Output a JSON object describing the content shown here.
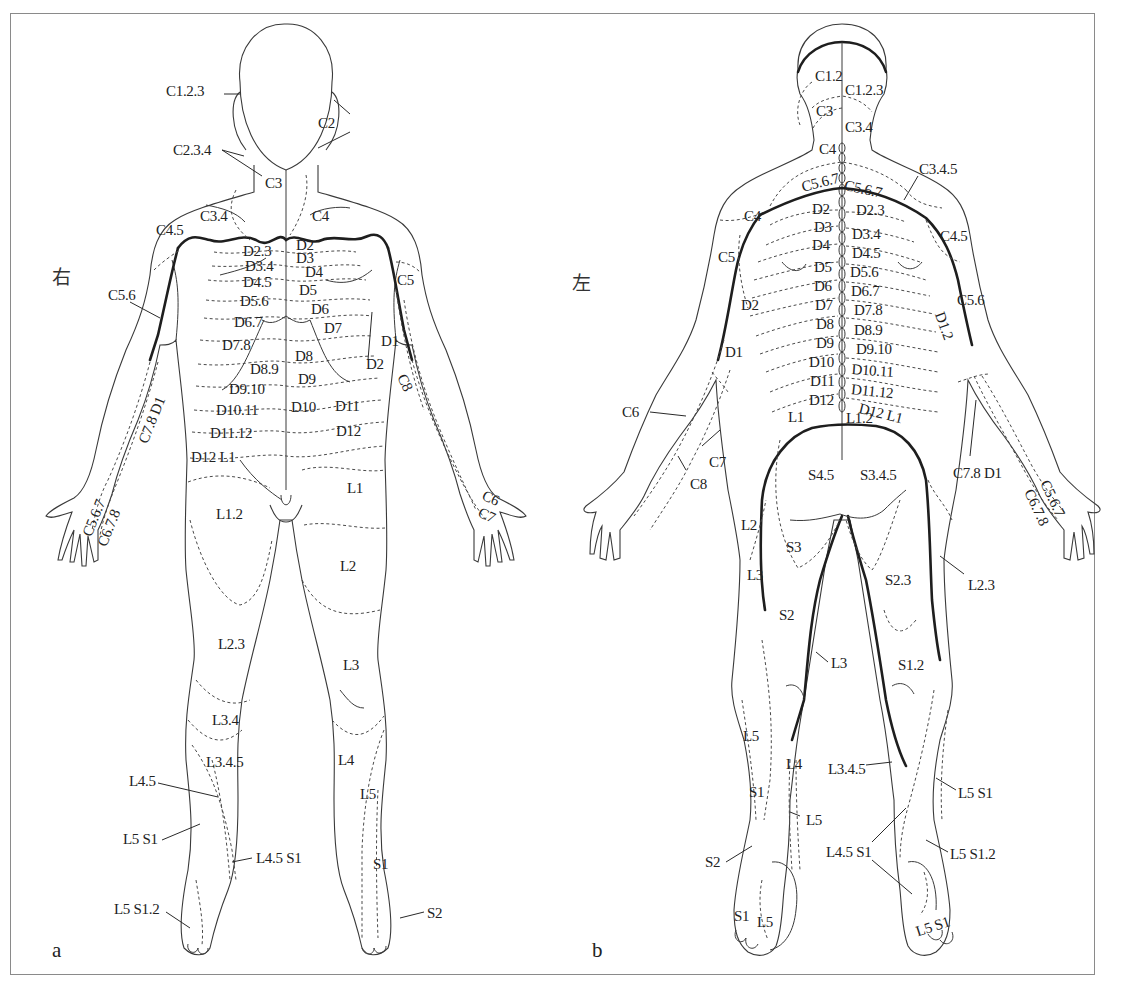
{
  "figure": {
    "panels": [
      {
        "id": "a",
        "letter": "a",
        "view": "anterior",
        "side_label": "右",
        "side_pos": [
          52,
          262
        ],
        "letter_pos": [
          52,
          938
        ]
      },
      {
        "id": "b",
        "letter": "b",
        "view": "posterior",
        "side_label": "左",
        "side_pos": [
          572,
          268
        ],
        "letter_pos": [
          592,
          938
        ]
      }
    ],
    "colors": {
      "line": "#3a3a3a",
      "heavy_line": "#1e1e1e",
      "border": "#8a8a8a",
      "text": "#222222",
      "background": "#ffffff"
    }
  },
  "labels_a": [
    {
      "t": "C1.2.3",
      "x": 166,
      "y": 84
    },
    {
      "t": "C2",
      "x": 318,
      "y": 116
    },
    {
      "t": "C2.3.4",
      "x": 173,
      "y": 143
    },
    {
      "t": "C3",
      "x": 265,
      "y": 176
    },
    {
      "t": "C3.4",
      "x": 200,
      "y": 209
    },
    {
      "t": "C4",
      "x": 312,
      "y": 209
    },
    {
      "t": "C4.5",
      "x": 156,
      "y": 223
    },
    {
      "t": "D2.3",
      "x": 243,
      "y": 244
    },
    {
      "t": "D2",
      "x": 296,
      "y": 238
    },
    {
      "t": "D3",
      "x": 296,
      "y": 251
    },
    {
      "t": "D3.4",
      "x": 245,
      "y": 259
    },
    {
      "t": "D4",
      "x": 305,
      "y": 265
    },
    {
      "t": "D4.5",
      "x": 243,
      "y": 275
    },
    {
      "t": "D5",
      "x": 299,
      "y": 283
    },
    {
      "t": "C5",
      "x": 397,
      "y": 273
    },
    {
      "t": "C5.6",
      "x": 108,
      "y": 288
    },
    {
      "t": "D5.6",
      "x": 240,
      "y": 294
    },
    {
      "t": "D6",
      "x": 311,
      "y": 302
    },
    {
      "t": "D6.7",
      "x": 234,
      "y": 315
    },
    {
      "t": "D7",
      "x": 324,
      "y": 321
    },
    {
      "t": "D1",
      "x": 381,
      "y": 334
    },
    {
      "t": "D7.8",
      "x": 222,
      "y": 338
    },
    {
      "t": "D8",
      "x": 295,
      "y": 349
    },
    {
      "t": "D2",
      "x": 366,
      "y": 357
    },
    {
      "t": "D8.9",
      "x": 250,
      "y": 362
    },
    {
      "t": "D9",
      "x": 298,
      "y": 372
    },
    {
      "t": "D9.10",
      "x": 229,
      "y": 382
    },
    {
      "t": "D10.11",
      "x": 216,
      "y": 403
    },
    {
      "t": "D10",
      "x": 291,
      "y": 400
    },
    {
      "t": "D11",
      "x": 335,
      "y": 399
    },
    {
      "t": "D11.12",
      "x": 210,
      "y": 426
    },
    {
      "t": "D12",
      "x": 336,
      "y": 424
    },
    {
      "t": "D12 L1",
      "x": 191,
      "y": 450
    },
    {
      "t": "L1",
      "x": 347,
      "y": 481
    },
    {
      "t": "L1.2",
      "x": 216,
      "y": 507
    },
    {
      "t": "L2",
      "x": 340,
      "y": 559
    },
    {
      "t": "L2.3",
      "x": 218,
      "y": 637
    },
    {
      "t": "L3",
      "x": 343,
      "y": 658
    },
    {
      "t": "L3.4",
      "x": 212,
      "y": 713
    },
    {
      "t": "L3.4.5",
      "x": 206,
      "y": 755
    },
    {
      "t": "L4",
      "x": 338,
      "y": 753
    },
    {
      "t": "L4.5",
      "x": 129,
      "y": 774
    },
    {
      "t": "L5",
      "x": 360,
      "y": 787
    },
    {
      "t": "L5 S1",
      "x": 123,
      "y": 832
    },
    {
      "t": "L4.5 S1",
      "x": 256,
      "y": 851
    },
    {
      "t": "S1",
      "x": 373,
      "y": 857
    },
    {
      "t": "L5 S1.2",
      "x": 114,
      "y": 902
    },
    {
      "t": "S2",
      "x": 427,
      "y": 906
    },
    {
      "t": "C7.8 D1",
      "x": 136,
      "y": 440,
      "rot": -68
    },
    {
      "t": "C5.6.7",
      "x": 80,
      "y": 533,
      "rot": -68
    },
    {
      "t": "C6.7.8",
      "x": 95,
      "y": 543,
      "rot": -68
    },
    {
      "t": "C8",
      "x": 408,
      "y": 372,
      "rot": 65
    },
    {
      "t": "C6",
      "x": 486,
      "y": 488,
      "rot": 25
    },
    {
      "t": "C7",
      "x": 482,
      "y": 505,
      "rot": 25
    }
  ],
  "labels_b": [
    {
      "t": "C1.2",
      "x": 815,
      "y": 69
    },
    {
      "t": "C1.2.3",
      "x": 845,
      "y": 83
    },
    {
      "t": "C3",
      "x": 816,
      "y": 104
    },
    {
      "t": "C3.4",
      "x": 845,
      "y": 120
    },
    {
      "t": "C4",
      "x": 819,
      "y": 142
    },
    {
      "t": "C3.4.5",
      "x": 919,
      "y": 162
    },
    {
      "t": "C5.6.7",
      "x": 800,
      "y": 180,
      "rot": -14
    },
    {
      "t": "C5.6.7",
      "x": 846,
      "y": 178,
      "rot": 12
    },
    {
      "t": "C4",
      "x": 744,
      "y": 209
    },
    {
      "t": "D2",
      "x": 812,
      "y": 202
    },
    {
      "t": "D2.3",
      "x": 856,
      "y": 203
    },
    {
      "t": "D3",
      "x": 814,
      "y": 220
    },
    {
      "t": "D3.4",
      "x": 852,
      "y": 227
    },
    {
      "t": "C4.5",
      "x": 940,
      "y": 229
    },
    {
      "t": "D4",
      "x": 812,
      "y": 238
    },
    {
      "t": "D4.5",
      "x": 852,
      "y": 246
    },
    {
      "t": "C5",
      "x": 718,
      "y": 250
    },
    {
      "t": "D5",
      "x": 814,
      "y": 260
    },
    {
      "t": "D5.6",
      "x": 850,
      "y": 265
    },
    {
      "t": "D6",
      "x": 814,
      "y": 279
    },
    {
      "t": "D6.7",
      "x": 851,
      "y": 284
    },
    {
      "t": "D2",
      "x": 741,
      "y": 298
    },
    {
      "t": "C5.6",
      "x": 957,
      "y": 293
    },
    {
      "t": "D7",
      "x": 815,
      "y": 298
    },
    {
      "t": "D7.8",
      "x": 854,
      "y": 303
    },
    {
      "t": "D8",
      "x": 816,
      "y": 317
    },
    {
      "t": "D8.9",
      "x": 854,
      "y": 323
    },
    {
      "t": "D9",
      "x": 816,
      "y": 336
    },
    {
      "t": "D9.10",
      "x": 856,
      "y": 342
    },
    {
      "t": "D1",
      "x": 725,
      "y": 345
    },
    {
      "t": "D10",
      "x": 809,
      "y": 355
    },
    {
      "t": "D10.11",
      "x": 852,
      "y": 362,
      "rot": 4
    },
    {
      "t": "D11",
      "x": 810,
      "y": 374
    },
    {
      "t": "D11.12",
      "x": 852,
      "y": 382,
      "rot": 6
    },
    {
      "t": "D12",
      "x": 809,
      "y": 393
    },
    {
      "t": "D12 L1",
      "x": 861,
      "y": 401,
      "rot": 14
    },
    {
      "t": "L1",
      "x": 788,
      "y": 410
    },
    {
      "t": "L1.2",
      "x": 846,
      "y": 411
    },
    {
      "t": "C6",
      "x": 622,
      "y": 405
    },
    {
      "t": "C7",
      "x": 709,
      "y": 455
    },
    {
      "t": "C8",
      "x": 690,
      "y": 477
    },
    {
      "t": "S4.5",
      "x": 808,
      "y": 468
    },
    {
      "t": "S3.4.5",
      "x": 860,
      "y": 468
    },
    {
      "t": "C7.8 D1",
      "x": 953,
      "y": 466
    },
    {
      "t": "L2",
      "x": 741,
      "y": 518
    },
    {
      "t": "S3",
      "x": 786,
      "y": 540
    },
    {
      "t": "L3",
      "x": 747,
      "y": 568
    },
    {
      "t": "S2.3",
      "x": 885,
      "y": 573
    },
    {
      "t": "L2.3",
      "x": 968,
      "y": 578
    },
    {
      "t": "S2",
      "x": 779,
      "y": 608
    },
    {
      "t": "L3",
      "x": 831,
      "y": 656
    },
    {
      "t": "S1.2",
      "x": 898,
      "y": 658
    },
    {
      "t": "L5",
      "x": 743,
      "y": 729
    },
    {
      "t": "L4",
      "x": 786,
      "y": 757
    },
    {
      "t": "L3.4.5",
      "x": 828,
      "y": 762
    },
    {
      "t": "L5 S1",
      "x": 958,
      "y": 786
    },
    {
      "t": "S1",
      "x": 749,
      "y": 785
    },
    {
      "t": "L5",
      "x": 806,
      "y": 813
    },
    {
      "t": "L4.5 S1",
      "x": 826,
      "y": 845
    },
    {
      "t": "L5 S1.2",
      "x": 950,
      "y": 847
    },
    {
      "t": "S2",
      "x": 705,
      "y": 855
    },
    {
      "t": "S1",
      "x": 734,
      "y": 909
    },
    {
      "t": "L5",
      "x": 757,
      "y": 915
    },
    {
      "t": "L5 S1",
      "x": 914,
      "y": 925,
      "rot": -18
    },
    {
      "t": "D1.2",
      "x": 946,
      "y": 310,
      "rot": 70
    },
    {
      "t": "C5.6.7",
      "x": 1051,
      "y": 478,
      "rot": 65
    },
    {
      "t": "C6.7.8",
      "x": 1035,
      "y": 487,
      "rot": 65
    }
  ]
}
